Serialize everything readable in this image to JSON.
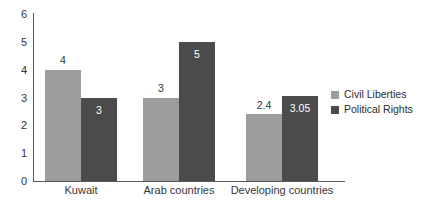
{
  "chart_data": {
    "type": "bar",
    "title": "",
    "subtitle": "",
    "xlabel": "",
    "ylabel": "",
    "ylim": [
      0,
      6
    ],
    "yticks": [
      "0",
      "1",
      "2",
      "3",
      "4",
      "5",
      "6"
    ],
    "grid": false,
    "legend_position": "right",
    "categories": [
      "Kuwait",
      "Arab countries",
      "Developing countries"
    ],
    "series": [
      {
        "name": "Civil Liberties",
        "color": "#9d9d9d",
        "values": [
          4,
          3,
          2.4
        ],
        "labels": [
          "4",
          "3",
          "2.4"
        ],
        "label_placement": [
          "above",
          "above",
          "above"
        ]
      },
      {
        "name": "Political Rights",
        "color": "#4b4b4b",
        "values": [
          3,
          5,
          3.05
        ],
        "labels": [
          "3",
          "5",
          "3.05"
        ],
        "label_placement": [
          "inside",
          "inside",
          "inside"
        ]
      }
    ]
  },
  "legend": {
    "items": [
      {
        "label": "Civil Liberties",
        "color": "#9d9d9d"
      },
      {
        "label": "Political Rights",
        "color": "#4b4b4b"
      }
    ]
  },
  "axis": {
    "y_max": 6,
    "y_min": 0,
    "ticks": [
      "0",
      "1",
      "2",
      "3",
      "4",
      "5",
      "6"
    ],
    "line_color": "#58595b"
  }
}
